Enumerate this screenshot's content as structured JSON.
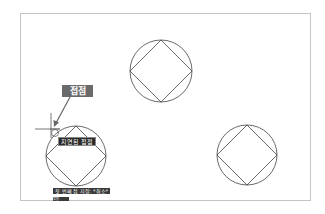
{
  "drawing": {
    "colors": {
      "background": "#ffffff",
      "frame": "#c4c4c4",
      "geometry": "#444444",
      "crosshair": "#555555",
      "callout_bg": "#6a6a6a",
      "tooltip_bg": "#2a2a2a"
    },
    "shapes": [
      {
        "type": "circle-with-inscribed-square",
        "cx": 161,
        "cy": 71,
        "r": 31
      },
      {
        "type": "circle-with-inscribed-square",
        "cx": 76,
        "cy": 156,
        "r": 30
      },
      {
        "type": "circle-with-inscribed-square",
        "cx": 247,
        "cy": 155,
        "r": 30
      }
    ],
    "crosshair": {
      "x": 51,
      "y": 129
    }
  },
  "annotation": {
    "callout_label": "접점"
  },
  "osnap_tooltip": {
    "label": "지연된 접점"
  },
  "command_line": {
    "history": "첫 번째 점 지정: *취소*",
    "prompt": "명령:"
  }
}
